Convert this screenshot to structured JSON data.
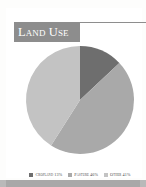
{
  "card": {
    "title": "Land Use",
    "background_color": "#ffffff",
    "title_banner_color": "#8d8d8d",
    "title_text_color": "#ffffff",
    "rule_color": "#8e8e8e"
  },
  "legend": {
    "items": [
      {
        "label": "Cropland 13%",
        "color": "#6e6e6e"
      },
      {
        "label": "Pasture 46%",
        "color": "#a9a9a9"
      },
      {
        "label": "Other 41%",
        "color": "#c3c3c3"
      }
    ]
  },
  "footer": {
    "bar_color": "#a8a8a8"
  },
  "chart_data": {
    "type": "pie",
    "title": "Land Use",
    "labels": [
      "Cropland",
      "Pasture",
      "Other"
    ],
    "values": [
      13,
      46,
      41
    ],
    "value_suffix": "%",
    "colors": [
      "#6e6e6e",
      "#a9a9a9",
      "#c3c3c3"
    ],
    "start_angle_deg": 0,
    "direction": "clockwise",
    "legend_position": "bottom",
    "grid": false,
    "center": {
      "cx": 68,
      "cy": 56
    },
    "radius": 54,
    "xlabel": "",
    "ylabel": ""
  }
}
